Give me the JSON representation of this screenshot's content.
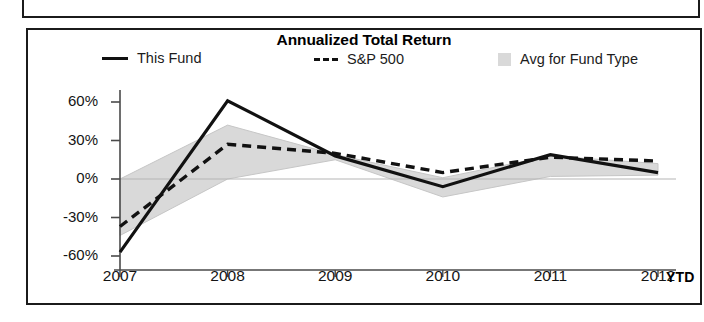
{
  "panel": {
    "title": "Annualized Total Return"
  },
  "legend": {
    "entries": [
      {
        "label": "This Fund",
        "marker": "solid-line-icon"
      },
      {
        "label": "S&P 500",
        "marker": "dashed-line-icon"
      },
      {
        "label": "Avg for Fund Type",
        "marker": "shaded-swatch-icon"
      }
    ]
  },
  "axis": {
    "y_ticks": [
      "60%",
      "30%",
      "0%",
      "-30%",
      "-60%"
    ],
    "x_ticks": [
      "2007",
      "2008",
      "2009",
      "2010",
      "2011",
      "2012"
    ],
    "x_suffix": "YTD"
  },
  "colors": {
    "line_this_fund": "#111111",
    "line_sp500": "#111111",
    "band_avg_fund_type": "#d9d9d9",
    "axis": "#4a4a4a",
    "frame": "#1b1b1b",
    "text": "#141414"
  },
  "chart_data": {
    "type": "line",
    "title": "Annualized Total Return",
    "xlabel": "",
    "ylabel": "",
    "x": [
      "2007",
      "2008",
      "2009",
      "2010",
      "2011",
      "2012"
    ],
    "x_note": "2012 is YTD",
    "ylim": [
      -60,
      60
    ],
    "ytick_values": [
      60,
      30,
      0,
      -30,
      -60
    ],
    "grid": false,
    "legend_position": "top",
    "series": [
      {
        "name": "This Fund",
        "style": "solid",
        "values": [
          -57,
          61,
          18,
          -6,
          19,
          5
        ]
      },
      {
        "name": "S&P 500",
        "style": "dashed",
        "values": [
          -37,
          27,
          20,
          5,
          17,
          14
        ]
      }
    ],
    "band": {
      "name": "Avg for Fund Type",
      "style": "shaded",
      "upper": [
        0,
        42,
        19,
        1,
        18,
        12
      ],
      "lower": [
        -44,
        0,
        15,
        -14,
        2,
        3
      ]
    }
  }
}
